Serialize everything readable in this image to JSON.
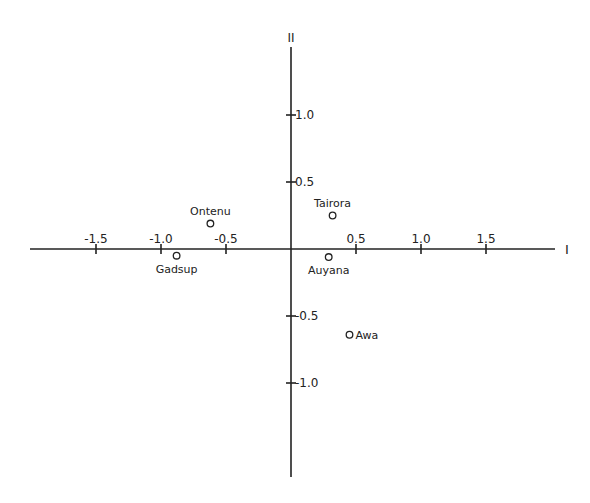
{
  "chart_data": {
    "type": "scatter",
    "title": "",
    "xlabel": "I",
    "ylabel": "II",
    "xlim": [
      -2.0,
      2.0
    ],
    "ylim": [
      -1.7,
      1.5
    ],
    "grid": false,
    "legend": null,
    "x_ticks": [
      {
        "value": -1.5,
        "label": "-1.5"
      },
      {
        "value": -1.0,
        "label": "-1.0"
      },
      {
        "value": -0.5,
        "label": "-0.5"
      },
      {
        "value": 0.5,
        "label": "0.5"
      },
      {
        "value": 1.0,
        "label": "1.0"
      },
      {
        "value": 1.5,
        "label": "1.5"
      }
    ],
    "y_ticks": [
      {
        "value": 1.0,
        "label": "1.0"
      },
      {
        "value": 0.5,
        "label": "0.5"
      },
      {
        "value": -0.5,
        "label": "-0.5"
      },
      {
        "value": -1.0,
        "label": "-1.0"
      }
    ],
    "points": [
      {
        "label": "Ontenu",
        "x": -0.62,
        "y": 0.19,
        "label_pos": "above"
      },
      {
        "label": "Gadsup",
        "x": -0.88,
        "y": -0.05,
        "label_pos": "below"
      },
      {
        "label": "Tairora",
        "x": 0.32,
        "y": 0.25,
        "label_pos": "above"
      },
      {
        "label": "Auyana",
        "x": 0.29,
        "y": -0.06,
        "label_pos": "below"
      },
      {
        "label": "Awa",
        "x": 0.45,
        "y": -0.64,
        "label_pos": "right"
      }
    ]
  }
}
